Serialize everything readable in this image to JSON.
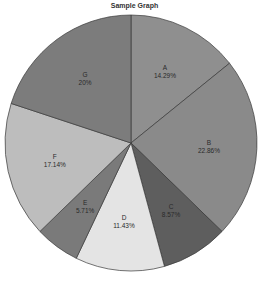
{
  "chart_data": {
    "type": "pie",
    "title": "Sample Graph",
    "categories": [
      "A",
      "B",
      "C",
      "D",
      "E",
      "F",
      "G"
    ],
    "values": [
      14.29,
      22.86,
      8.57,
      11.43,
      5.71,
      17.14,
      20
    ],
    "labels": [
      "14.29%",
      "22.86%",
      "8.57%",
      "11.43%",
      "5.71%",
      "17.14%",
      "20%"
    ],
    "colors": [
      "#8f8f8f",
      "#8a8a8a",
      "#5e5e5e",
      "#e4e4e4",
      "#7a7a7a",
      "#bdbdbd",
      "#7c7c7c"
    ],
    "start_angle": "12 o'clock",
    "direction": "clockwise",
    "legend": "none",
    "xlabel": "",
    "ylabel": ""
  }
}
